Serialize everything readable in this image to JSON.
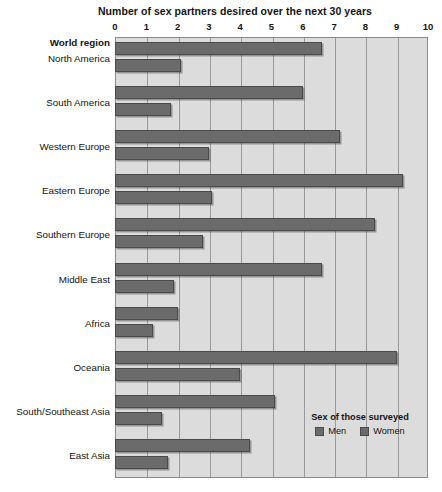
{
  "chart_data": {
    "type": "bar",
    "title": "Number of sex partners desired over the next 30 years",
    "xlabel": "Number of sex partners desired over the next 30 years",
    "ylabel": "World region",
    "orientation": "horizontal",
    "xlim": [
      0,
      10
    ],
    "xticks": [
      "0",
      "1",
      "2",
      "3",
      "4",
      "5",
      "6",
      "7",
      "8",
      "9",
      "10"
    ],
    "grid": true,
    "legend_position": "inside-bottom-right",
    "legend_title": "Sex of those surveyed",
    "categories": [
      "North America",
      "South America",
      "Western Europe",
      "Eastern Europe",
      "Southern Europe",
      "Middle East",
      "Africa",
      "Oceania",
      "South/Southeast Asia",
      "East Asia"
    ],
    "series": [
      {
        "name": "Men",
        "color": "#6b6b6b",
        "values": [
          6.6,
          6.0,
          7.2,
          9.2,
          8.3,
          6.6,
          2.0,
          9.0,
          5.1,
          4.3
        ]
      },
      {
        "name": "Women",
        "color": "#6b6b6b",
        "values": [
          2.1,
          1.8,
          3.0,
          3.1,
          2.8,
          1.9,
          1.2,
          4.0,
          1.5,
          1.7
        ]
      }
    ]
  },
  "colors": {
    "bar": "#6b6b6b",
    "bar_border": "#4a4a4a",
    "plot_background": "#dcdcdc",
    "gridline": "#9a9a9a",
    "page_background": "#ffffff",
    "text": "#141414"
  }
}
